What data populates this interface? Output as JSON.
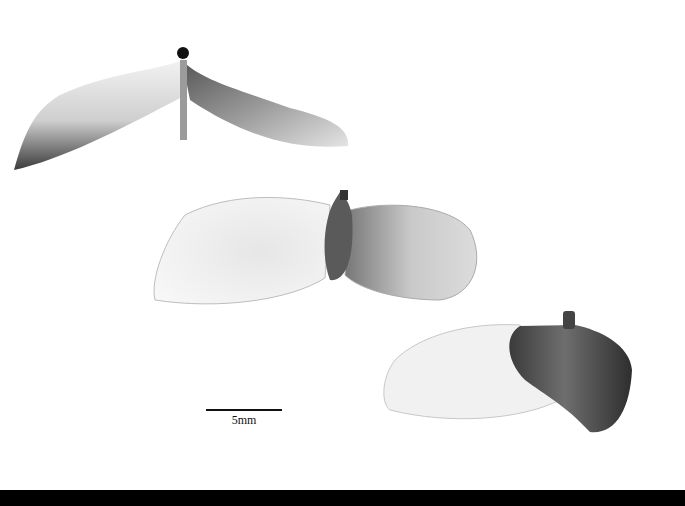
{
  "image": {
    "description": "Grayscale photograph of three winged seeds (samaras) on white background with scale bar",
    "background_color": "#ffffff",
    "bottom_band_color": "#000000",
    "specimens": [
      {
        "name": "samara-top",
        "view": "side, wings spread downward with central stalk"
      },
      {
        "name": "samara-middle",
        "view": "top-down, two broad pale wings with central dark seed body"
      },
      {
        "name": "samara-bottom",
        "view": "oblique, one pale wing and one dark wing/seed body"
      }
    ]
  },
  "scale": {
    "label": "5mm"
  }
}
